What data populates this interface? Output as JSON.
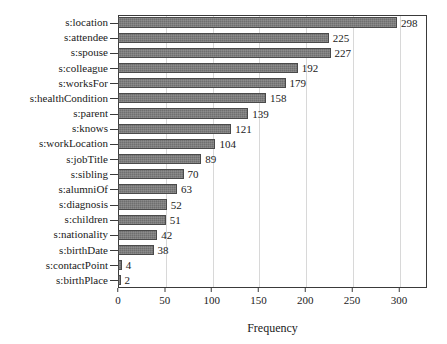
{
  "chart_data": {
    "type": "bar",
    "orientation": "horizontal",
    "title": "",
    "xlabel": "Frequency",
    "ylabel": "",
    "xlim": [
      0,
      330
    ],
    "ylim": [
      0,
      18
    ],
    "grid": true,
    "legend": null,
    "xticks": [
      0,
      50,
      100,
      150,
      200,
      250,
      300
    ],
    "xtick_labels": [
      "0",
      "50",
      "100",
      "150",
      "200",
      "250",
      "300"
    ],
    "bar_color": "#6f6f6f",
    "bar_edge_color": "#4a4a4a",
    "value_label_position": "outside-right",
    "categories": [
      "s:location",
      "s:attendee",
      "s:spouse",
      "s:colleague",
      "s:worksFor",
      "s:healthCondition",
      "s:parent",
      "s:knows",
      "s:workLocation",
      "s:jobTitle",
      "s:sibling",
      "s:alumniOf",
      "s:diagnosis",
      "s:children",
      "s:nationality",
      "s:birthDate",
      "s:contactPoint",
      "s:birthPlace"
    ],
    "values": [
      298,
      225,
      227,
      192,
      179,
      158,
      139,
      121,
      104,
      89,
      70,
      63,
      52,
      51,
      42,
      38,
      4,
      2
    ],
    "value_labels": [
      "298",
      "225",
      "227",
      "192",
      "179",
      "158",
      "139",
      "121",
      "104",
      "89",
      "70",
      "63",
      "52",
      "51",
      "42",
      "38",
      "4",
      "2"
    ]
  }
}
